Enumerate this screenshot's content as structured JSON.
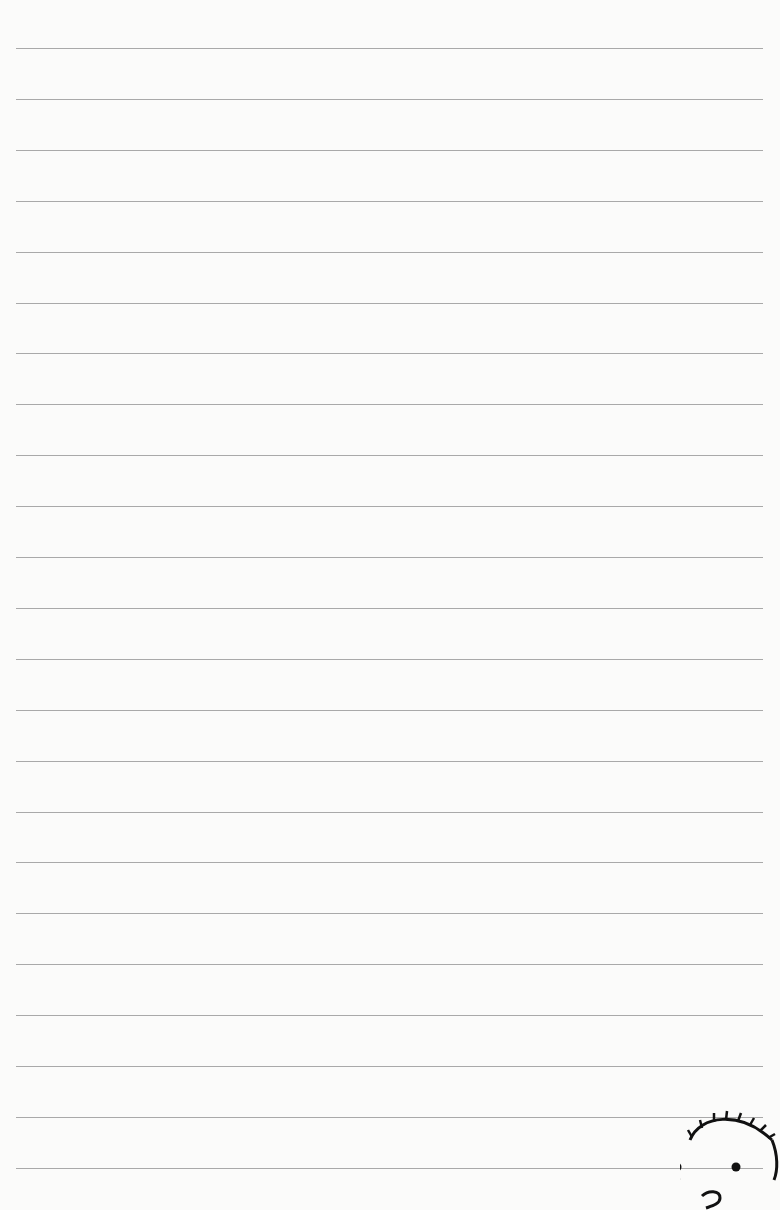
{
  "page": {
    "type": "lined-notebook-page",
    "background_color": "#fbfbfa",
    "line_color": "#9a9a9a",
    "line_count": 23,
    "first_line_y": 48,
    "line_spacing": 50.9,
    "line_left": 16,
    "line_right": 763
  },
  "doodle": {
    "icon": "cartoon-face-icon",
    "description": "Partial cartoon face with spiky hair, two dot eyes and curled nose/mouth in bottom-right corner"
  }
}
